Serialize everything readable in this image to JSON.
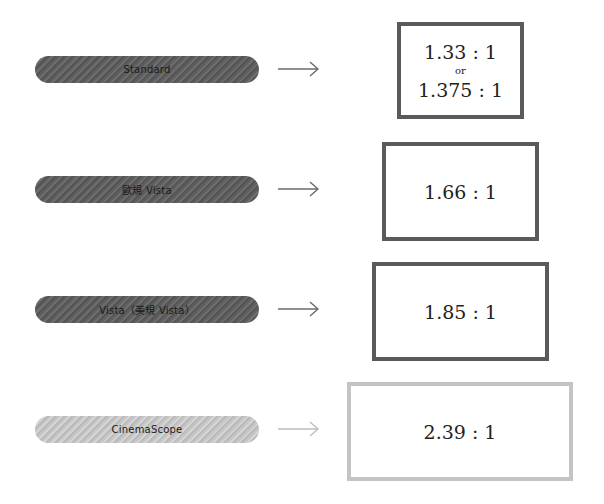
{
  "rows": [
    {
      "label": "Standard",
      "ratio": "1.33 : 1",
      "separator": "or",
      "alt_ratio": "1.375 : 1",
      "style": "dark"
    },
    {
      "label": "歐規 Vista",
      "ratio": "1.66 : 1",
      "style": "dark"
    },
    {
      "label": "Vista（美規 Vista）",
      "ratio": "1.85 : 1",
      "style": "dark"
    },
    {
      "label": "CinemaScope",
      "ratio": "2.39 : 1",
      "style": "light"
    }
  ],
  "colors": {
    "dark_pill": "#5e5e5e",
    "light_pill": "#c6c6c6",
    "dark_border": "#5a5a5a",
    "light_border": "#c4c4c4",
    "dark_arrow": "#6a6a6a",
    "light_arrow": "#bdbdbd"
  }
}
